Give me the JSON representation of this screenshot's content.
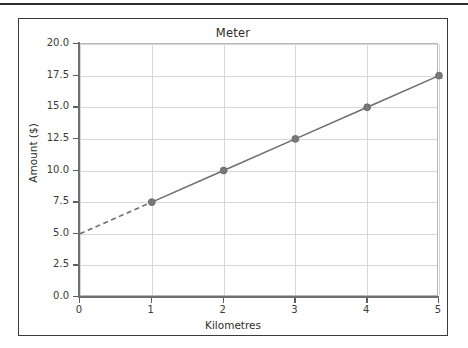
{
  "figure": {
    "title": "Meter",
    "xaxis_label": "Kilometres",
    "yaxis_label": "Amount ($)",
    "frame_color": "#3a3a3a",
    "grid_color": "#d6d6d6",
    "line_color": "#6e6e6e",
    "marker_color": "#787878",
    "background": "#ffffff"
  },
  "chart_data": {
    "type": "line",
    "title": "Meter",
    "xlabel": "Kilometres",
    "ylabel": "Amount ($)",
    "xlim": [
      0,
      5
    ],
    "ylim": [
      0.0,
      20.0
    ],
    "grid": true,
    "legend": "none",
    "xticks": [
      0,
      1,
      2,
      3,
      4,
      5
    ],
    "xtick_labels": [
      "0",
      "1",
      "2",
      "3",
      "4",
      "5"
    ],
    "yticks": [
      0.0,
      2.5,
      5.0,
      7.5,
      10.0,
      12.5,
      15.0,
      17.5,
      20.0
    ],
    "ytick_labels": [
      "0.0",
      "2.5",
      "5.0",
      "7.5",
      "10.0",
      "12.5",
      "15.0",
      "17.5",
      "20.0"
    ],
    "series": [
      {
        "name": "extrapolated",
        "style": "dashed",
        "markers": false,
        "x": [
          0,
          1
        ],
        "values": [
          5.0,
          7.5
        ]
      },
      {
        "name": "meter",
        "style": "solid",
        "markers": true,
        "x": [
          1,
          2,
          3,
          4,
          5
        ],
        "values": [
          7.5,
          10.0,
          12.5,
          15.0,
          17.5
        ]
      }
    ],
    "annotations": []
  }
}
